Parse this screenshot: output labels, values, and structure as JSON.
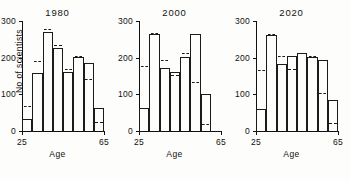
{
  "figure": {
    "ylabel": "No of scientists",
    "xlabel": "Age"
  },
  "axis": {
    "yticks": [
      0,
      100,
      200,
      300
    ],
    "ytick_labels": [
      "0",
      "100",
      "200",
      "300"
    ],
    "xticks": [
      25,
      65
    ],
    "xtick_labels": [
      "25",
      "65"
    ]
  },
  "chart_data": {
    "type": "bar",
    "title": "",
    "xlabel": "Age",
    "ylabel": "No of scientists",
    "xlim": [
      25,
      65
    ],
    "ylim": [
      0,
      300
    ],
    "grid": false,
    "legend": null,
    "bin_width": 5,
    "categories": [
      "25-30",
      "30-35",
      "35-40",
      "40-45",
      "45-50",
      "50-55",
      "55-60",
      "60-65"
    ],
    "panels": [
      {
        "title": "1980",
        "values": [
          35,
          160,
          272,
          230,
          163,
          205,
          187,
          65
        ],
        "reference_marks": [
          68,
          192,
          278,
          235,
          168,
          205,
          143,
          25
        ]
      },
      {
        "title": "2000",
        "values": [
          65,
          268,
          175,
          165,
          205,
          268,
          105,
          0
        ],
        "reference_marks": [
          178,
          268,
          195,
          152,
          212,
          135,
          20,
          0
        ]
      },
      {
        "title": "2020",
        "values": [
          62,
          265,
          185,
          208,
          215,
          205,
          197,
          88
        ],
        "reference_marks": [
          167,
          265,
          205,
          168,
          213,
          205,
          103,
          22
        ]
      }
    ]
  }
}
